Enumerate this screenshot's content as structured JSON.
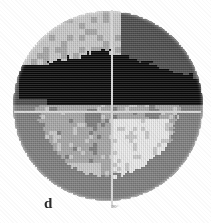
{
  "figure": {
    "panel_label": "d",
    "axis_tick_label": "90°",
    "caption_visible": false
  },
  "colors": {
    "background": "#ffffff",
    "reticle": "#d8d8d8",
    "label_text": "#2c2c2c",
    "tick_text": "#7a7a7a",
    "level_black": "#0a0a0a",
    "level_dark_gray": "#4e4e4e",
    "level_mid_gray": "#7f7f7f",
    "level_light_gray": "#a8a8a8",
    "level_pale_gray": "#c9c9c9",
    "level_near_white": "#ebebeb"
  },
  "geometry": {
    "disk_center_x": 108,
    "disk_center_y": 106,
    "disk_radius": 95,
    "reticle_center_x": 112,
    "reticle_center_y": 112
  },
  "chart_data": {
    "type": "heatmap",
    "title": "",
    "subtitle": "",
    "xlabel": "",
    "ylabel": "",
    "projection": "circular-disk",
    "grid": false,
    "legend": "none",
    "annotations": [
      "d",
      "90°"
    ],
    "shading_levels": [
      {
        "name": "black",
        "value": 6,
        "hex": "#0a0a0a"
      },
      {
        "name": "dark-gray",
        "value": 5,
        "hex": "#4e4e4e"
      },
      {
        "name": "mid-gray",
        "value": 4,
        "hex": "#7f7f7f"
      },
      {
        "name": "light-gray",
        "value": 3,
        "hex": "#a8a8a8"
      },
      {
        "name": "pale-gray",
        "value": 2,
        "hex": "#c9c9c9"
      },
      {
        "name": "near-white",
        "value": 1,
        "hex": "#ebebeb"
      }
    ],
    "regions": [
      {
        "label": "upper-center-right black lobe",
        "level": "black",
        "extent": "spans from x=55 to x=200, y=45 to y=115"
      },
      {
        "label": "upper-right dark band",
        "level": "dark-gray",
        "extent": "x=120 to x=205, y=12 to y=60"
      },
      {
        "label": "upper-left pale cap",
        "level": "pale-gray",
        "extent": "x=25 to x=115, y=12 to y=80"
      },
      {
        "label": "left dark patch",
        "level": "black",
        "extent": "x=16 to x=38, y=68 to y=92"
      },
      {
        "label": "left rim mid band",
        "level": "mid-gray",
        "extent": "x=13 to x=45, y=88 to y=170"
      },
      {
        "label": "lower-half light field",
        "level": "light-gray",
        "extent": "x=30 to x=185, y=115 to y=200"
      },
      {
        "label": "lower-center near-white patch",
        "level": "near-white",
        "extent": "x=110 to x=165, y=130 to y=185"
      },
      {
        "label": "lower-right mid band",
        "level": "mid-gray",
        "extent": "x=160 to x=200, y=120 to y=180"
      }
    ],
    "grid_nx": 64,
    "grid_ny": 64
  },
  "reticle": {
    "vertical_line": true,
    "horizontal_line": true
  }
}
